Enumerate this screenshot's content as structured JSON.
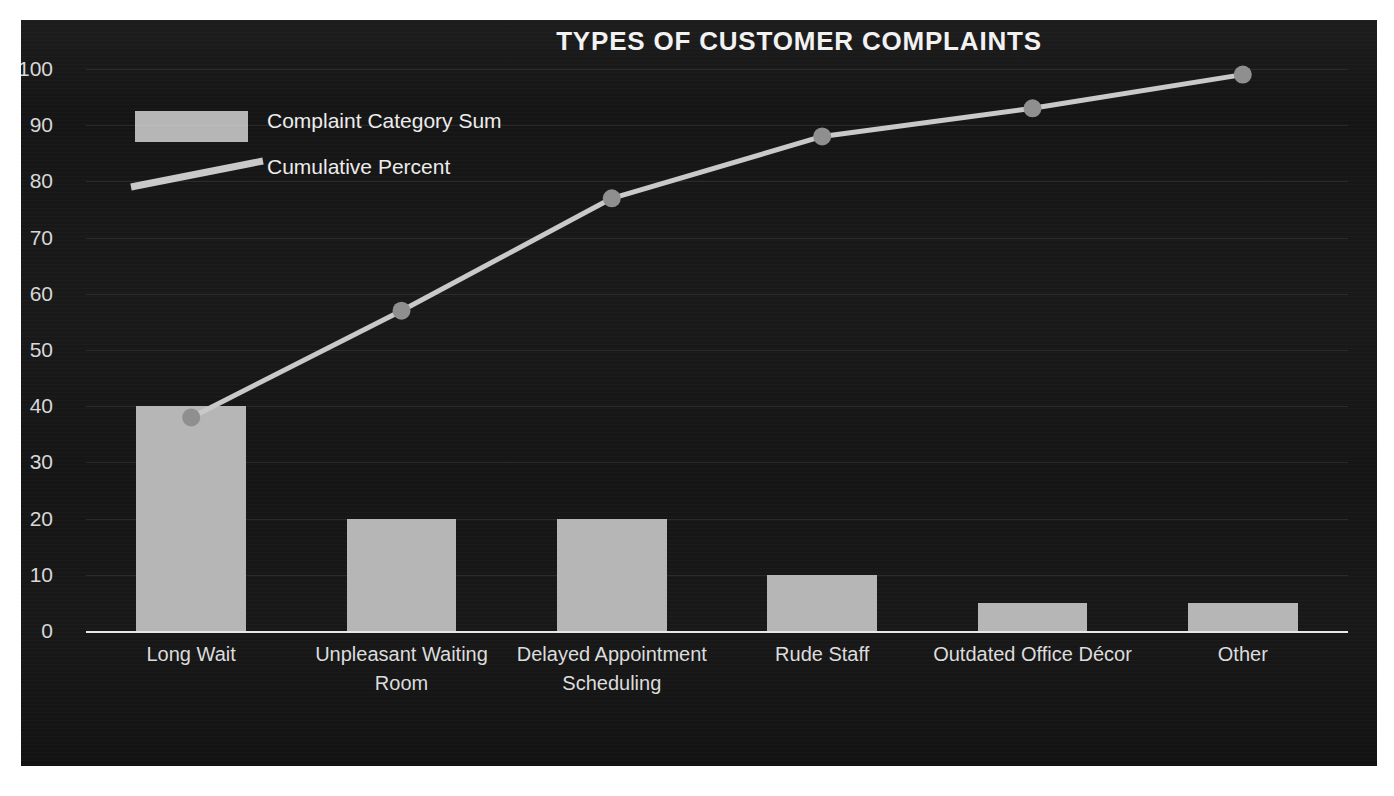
{
  "chart_data": {
    "type": "bar",
    "title": "TYPES OF CUSTOMER COMPLAINTS",
    "xlabel": "",
    "ylabel": "",
    "ylim": [
      0,
      100
    ],
    "grid": true,
    "legend_position": "upper-left-inside",
    "categories": [
      "Long Wait",
      "Unpleasant Waiting Room",
      "Delayed Appointment Scheduling",
      "Rude Staff",
      "Outdated Office Décor",
      "Other"
    ],
    "yticks": [
      0,
      10,
      20,
      30,
      40,
      50,
      60,
      70,
      80,
      90,
      100
    ],
    "series": [
      {
        "name": "Complaint Category Sum",
        "type": "bar",
        "color": "#b6b6b6",
        "values": [
          40,
          20,
          20,
          10,
          5,
          5
        ]
      },
      {
        "name": "Cumulative Percent",
        "type": "line",
        "color": "#c9c9c9",
        "values": [
          38,
          57,
          77,
          88,
          93,
          99
        ]
      }
    ]
  },
  "chart": {
    "title": "TYPES OF CUSTOMER COMPLAINTS",
    "legend": {
      "bar_label": "Complaint Category Sum",
      "line_label": "Cumulative Percent"
    },
    "yticks": [
      {
        "value": "100"
      },
      {
        "value": "90"
      },
      {
        "value": "80"
      },
      {
        "value": "70"
      },
      {
        "value": "60"
      },
      {
        "value": "50"
      },
      {
        "value": "40"
      },
      {
        "value": "30"
      },
      {
        "value": "20"
      },
      {
        "value": "10"
      },
      {
        "value": "0"
      }
    ],
    "categories": [
      {
        "label": "Long Wait"
      },
      {
        "label": "Unpleasant Waiting Room"
      },
      {
        "label": "Delayed Appointment Scheduling"
      },
      {
        "label": "Rude Staff"
      },
      {
        "label": "Outdated Office Décor"
      },
      {
        "label": "Other"
      }
    ],
    "colors": {
      "panel_background": "#151515",
      "bar_fill": "#b6b6b6",
      "line_stroke": "#c9c9c9",
      "marker_fill": "#8f8f8f",
      "text": "#ececec",
      "axis": "#e8e8e8",
      "gridline": "rgba(255,255,255,0.085)",
      "page_background": "#ffffff"
    }
  }
}
